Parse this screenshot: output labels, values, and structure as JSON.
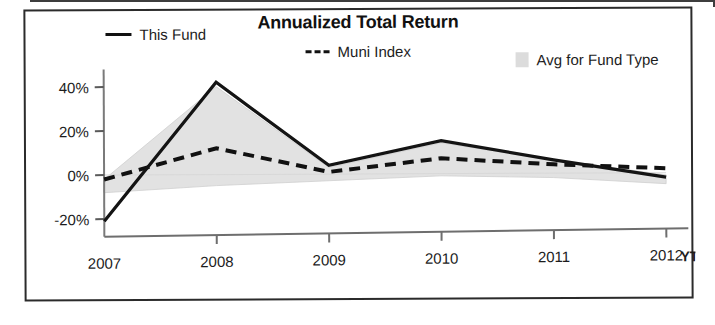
{
  "chart_data": {
    "type": "line",
    "title": "Annualized Total Return",
    "xlabel": "",
    "ylabel": "",
    "categories": [
      "2007",
      "2008",
      "2009",
      "2010",
      "2011",
      "2012"
    ],
    "x_tick_suffix": "YTD",
    "y_ticks": [
      "40%",
      "20%",
      "0%",
      "-20%"
    ],
    "y_tick_values": [
      40,
      20,
      0,
      -20
    ],
    "ylim": [
      -28,
      48
    ],
    "grid": false,
    "legend_position": "top",
    "series": [
      {
        "name": "This Fund",
        "style": "solid",
        "color": "#111111",
        "values": [
          -21,
          42,
          4,
          15,
          6,
          -2
        ]
      },
      {
        "name": "Muni Index",
        "style": "dashed",
        "color": "#111111",
        "values": [
          -2,
          12,
          1,
          7,
          4,
          2
        ]
      },
      {
        "name": "Avg for Fund Type",
        "style": "area",
        "color": "#dcdcdc",
        "upper": [
          -2,
          40,
          3,
          14,
          6,
          -1
        ],
        "lower": [
          -8,
          -5,
          -3,
          -1,
          -2,
          -5
        ]
      }
    ]
  },
  "legend": {
    "items": [
      {
        "label": "This Fund",
        "marker": "solid-line-swatch"
      },
      {
        "label": "Muni Index",
        "marker": "dashed-line-swatch"
      },
      {
        "label": "Avg for Fund Type",
        "marker": "gray-area-swatch"
      }
    ]
  },
  "axes": {
    "y_labels": [
      "40%",
      "20%",
      "0%",
      "-20%"
    ],
    "x_labels": [
      "2007",
      "2008",
      "2009",
      "2010",
      "2011",
      "2012"
    ],
    "ytd_label": "YTD"
  }
}
